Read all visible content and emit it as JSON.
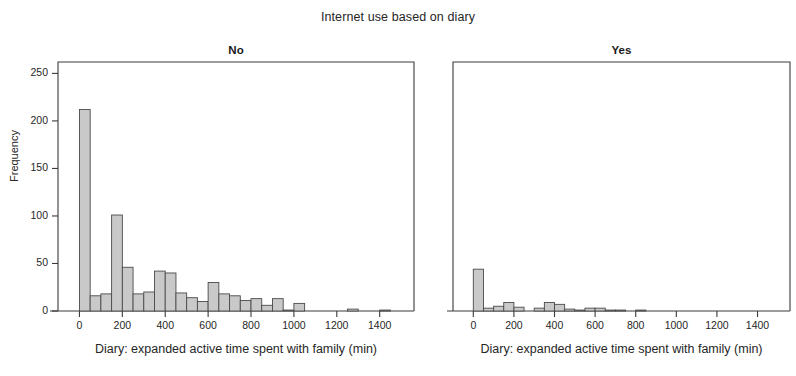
{
  "title": "Internet use based on diary",
  "axis": {
    "ylabel": "Frequency",
    "xlabel": "Diary: expanded active time spent with family (min)",
    "yticks": [
      "0",
      "50",
      "100",
      "150",
      "200",
      "250"
    ],
    "xticks": [
      "0",
      "200",
      "400",
      "600",
      "800",
      "1000",
      "1200",
      "1400"
    ]
  },
  "panels": [
    {
      "label": "No"
    },
    {
      "label": "Yes"
    }
  ],
  "chart_data": {
    "type": "bar",
    "title": "Internet use based on diary",
    "subtitle": "",
    "xlabel": "Diary: expanded active time spent with family (min)",
    "ylabel": "Frequency",
    "xlim": [
      -100,
      1560
    ],
    "ylim": [
      0,
      262
    ],
    "bin_width": 50,
    "grid": false,
    "legend": "none",
    "panel_layout": "side-by-side, shared axes",
    "ytick_values": [
      0,
      50,
      100,
      150,
      200,
      250
    ],
    "xtick_values": [
      0,
      200,
      400,
      600,
      800,
      1000,
      1200,
      1400
    ],
    "panels": [
      {
        "name": "No",
        "bin_centers": [
          25,
          75,
          125,
          175,
          225,
          275,
          325,
          375,
          425,
          475,
          525,
          575,
          625,
          675,
          725,
          775,
          825,
          875,
          925,
          975,
          1025,
          1075,
          1125,
          1175,
          1225,
          1275,
          1325,
          1375,
          1425,
          1475
        ],
        "values": [
          212,
          16,
          18,
          101,
          46,
          18,
          20,
          42,
          40,
          19,
          14,
          10,
          30,
          18,
          16,
          11,
          13,
          6,
          13,
          1,
          8,
          0,
          0,
          0,
          0,
          2,
          0,
          0,
          1,
          0
        ]
      },
      {
        "name": "Yes",
        "bin_centers": [
          25,
          75,
          125,
          175,
          225,
          275,
          325,
          375,
          425,
          475,
          525,
          575,
          625,
          675,
          725,
          775,
          825,
          875,
          925,
          975,
          1025,
          1075,
          1125,
          1175,
          1225,
          1275,
          1325,
          1375,
          1425,
          1475
        ],
        "values": [
          44,
          3,
          5,
          9,
          4,
          0,
          3,
          9,
          7,
          2,
          1,
          3,
          3,
          1,
          1,
          0,
          1,
          0,
          0,
          0,
          0,
          0,
          0,
          0,
          0,
          0,
          0,
          0,
          0,
          0
        ]
      }
    ]
  }
}
